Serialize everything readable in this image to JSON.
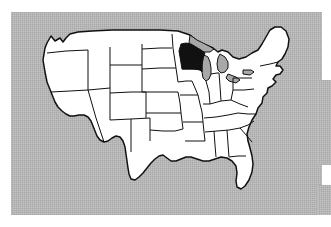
{
  "figure": {
    "kind": "locator-map",
    "projection_note": "contiguous 48 states, no labels",
    "highlight": {
      "region_name": "Wisconsin",
      "fill_color": "#111111",
      "is_shaded": true
    },
    "background": {
      "plate_color": "#a8a8a8",
      "plate_texture": "halftone-dither",
      "page_color": "#ffffff"
    },
    "land": {
      "fill_color": "#ffffff",
      "outline_color": "#111111"
    },
    "water": {
      "great_lakes_fill": "#a8a8a8"
    },
    "labels": [],
    "legend": [],
    "title": "",
    "caption": ""
  },
  "regions": [
    {
      "name": "Wisconsin",
      "shaded": true
    },
    {
      "name": "Minnesota",
      "shaded": false
    },
    {
      "name": "Michigan",
      "shaded": false
    },
    {
      "name": "Illinois",
      "shaded": false
    },
    {
      "name": "Iowa",
      "shaded": false
    },
    {
      "name": "Texas",
      "shaded": false
    },
    {
      "name": "Florida",
      "shaded": false
    },
    {
      "name": "Maine",
      "shaded": false
    },
    {
      "name": "California",
      "shaded": false
    }
  ]
}
